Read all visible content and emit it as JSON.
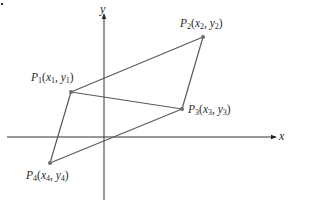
{
  "diagram": {
    "colors": {
      "axis": "#333333",
      "edge": "#5a5a5a",
      "point": "#6a6a6a",
      "text": "#2a2a2a"
    },
    "axes": {
      "x_label": "x",
      "y_label": "y",
      "origin_px": [
        104,
        137
      ]
    },
    "points": [
      {
        "id": "P1",
        "name": "P",
        "sub": "1",
        "coord": "(x1, y1)",
        "px": [
          71,
          92
        ]
      },
      {
        "id": "P2",
        "name": "P",
        "sub": "2",
        "coord": "(x2, y2)",
        "px": [
          203,
          37
        ]
      },
      {
        "id": "P3",
        "name": "P",
        "sub": "3",
        "coord": "(x3, y3)",
        "px": [
          182,
          109
        ]
      },
      {
        "id": "P4",
        "name": "P",
        "sub": "4",
        "coord": "(x4, y4)",
        "px": [
          50,
          163
        ]
      }
    ],
    "edges": [
      [
        "P1",
        "P2"
      ],
      [
        "P2",
        "P3"
      ],
      [
        "P3",
        "P4"
      ],
      [
        "P4",
        "P1"
      ],
      [
        "P1",
        "P3"
      ]
    ],
    "labels": {
      "p1": {
        "P": "P",
        "s": "1",
        "open": "(",
        "x": "x",
        "xs": "1",
        "comma": ", ",
        "y": "y",
        "ys": "1",
        "close": ")"
      },
      "p2": {
        "P": "P",
        "s": "2",
        "open": "(",
        "x": "x",
        "xs": "2",
        "comma": ", ",
        "y": "y",
        "ys": "2",
        "close": ")"
      },
      "p3": {
        "P": "P",
        "s": "3",
        "open": "(",
        "x": "x",
        "xs": "3",
        "comma": ", ",
        "y": "y",
        "ys": "3",
        "close": ")"
      },
      "p4": {
        "P": "P",
        "s": "4",
        "open": "(",
        "x": "x",
        "xs": "4",
        "comma": ", ",
        "y": "y",
        "ys": "4",
        "close": ")"
      }
    }
  }
}
